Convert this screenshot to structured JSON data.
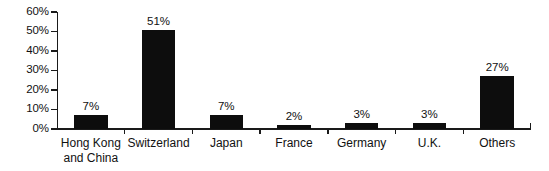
{
  "chart_data": {
    "type": "bar",
    "title": "",
    "subtitle": "",
    "xlabel": "",
    "ylabel": "",
    "categories": [
      "Hong Kong and China",
      "Switzerland",
      "Japan",
      "France",
      "Germany",
      "U.K.",
      "Others"
    ],
    "category_lines": [
      [
        "Hong Kong",
        "and China"
      ],
      [
        "Switzerland"
      ],
      [
        "Japan"
      ],
      [
        "France"
      ],
      [
        "Germany"
      ],
      [
        "U.K."
      ],
      [
        "Others"
      ]
    ],
    "values": [
      7,
      51,
      7,
      2,
      3,
      3,
      27
    ],
    "value_labels": [
      "7%",
      "51%",
      "7%",
      "2%",
      "3%",
      "3%",
      "27%"
    ],
    "ylim": [
      0,
      60
    ],
    "ytick_values": [
      0,
      10,
      20,
      30,
      40,
      50,
      60
    ],
    "ytick_labels": [
      "0%",
      "10%",
      "20%",
      "30%",
      "40%",
      "50%",
      "60%"
    ],
    "grid": false,
    "legend": null,
    "bar_color": "#0d0d0d",
    "axis_color": "#1a1a1a",
    "background_color": "#ffffff"
  }
}
